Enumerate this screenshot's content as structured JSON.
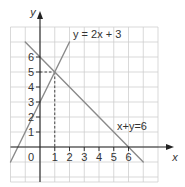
{
  "chart_data": {
    "type": "line",
    "title": "",
    "xlabel": "x",
    "ylabel": "y",
    "xlim": [
      -2,
      8
    ],
    "ylim": [
      -2,
      8
    ],
    "grid": true,
    "origin_label": "0",
    "x_ticks": [
      "1",
      "2",
      "3",
      "4",
      "5",
      "6"
    ],
    "x_tick_values": [
      1,
      2,
      3,
      4,
      5,
      6
    ],
    "y_ticks": [
      "1",
      "2",
      "3",
      "4",
      "5",
      "6"
    ],
    "y_tick_values": [
      1,
      2,
      3,
      4,
      5,
      6
    ],
    "series": [
      {
        "name": "y = 2x + 3",
        "label": "y = 2x + 3",
        "equation": "y = 2x + 3",
        "x": [
          -2,
          2
        ],
        "y": [
          -1,
          7
        ]
      },
      {
        "name": "x + y = 6",
        "label": "x+y=6",
        "equation": "x + y = 6",
        "x": [
          -1,
          7
        ],
        "y": [
          7,
          -1
        ]
      }
    ],
    "annotations": [
      {
        "type": "intersection",
        "x": 1,
        "y": 5,
        "style": "dashed guides to both axes"
      }
    ]
  },
  "colors": {
    "grid": "#cfcfcf",
    "axes": "#222222",
    "series_line": "#8a8a8a",
    "dashed": "#333333"
  }
}
